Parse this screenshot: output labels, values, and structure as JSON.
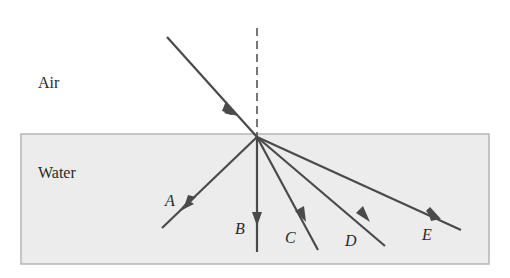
{
  "diagram": {
    "title": "",
    "media": {
      "upper": {
        "label": "Air"
      },
      "lower": {
        "label": "Water"
      }
    },
    "normal": {
      "style": "dashed"
    },
    "incident_ray": {
      "direction": "down-right toward interface"
    },
    "refracted_rays": [
      {
        "id": "A",
        "label": "A"
      },
      {
        "id": "B",
        "label": "B"
      },
      {
        "id": "C",
        "label": "C"
      },
      {
        "id": "D",
        "label": "D"
      },
      {
        "id": "E",
        "label": "E"
      }
    ],
    "colors": {
      "ray": "#4a4a4a",
      "water_fill": "#ececec",
      "water_border": "#b5b5b5",
      "text": "#2a2a2a"
    }
  }
}
